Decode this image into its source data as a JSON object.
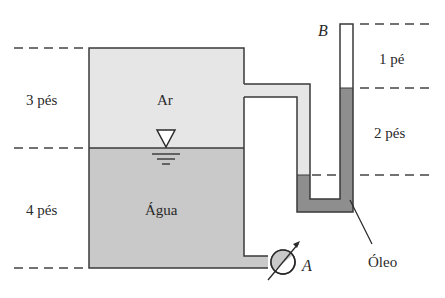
{
  "diagram": {
    "type": "manometer-tank",
    "colors": {
      "air": "#e6e6e6",
      "water": "#c9c9c9",
      "oil": "#8e8e8e",
      "outline": "#3a3a3a",
      "background": "#ffffff"
    },
    "tank": {
      "air_label": "Ar",
      "water_label": "Água"
    },
    "dimensions": {
      "air_height": "3 pés",
      "water_height": "4 pés",
      "upper_column": "1 pé",
      "oil_difference": "2 pés"
    },
    "points": {
      "gauge": "A",
      "open_top": "B"
    },
    "fluid_label": "Óleo"
  }
}
